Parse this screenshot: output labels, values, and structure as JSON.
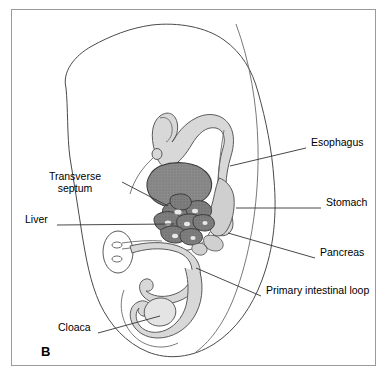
{
  "figure": {
    "panel_letter": "B",
    "caption_absent": true,
    "border_color": "#9a9a9a",
    "background_color": "#ffffff"
  },
  "palette": {
    "outline": "#4a4a4a",
    "gut_fill": "#d8d8d8",
    "gut_stroke": "#5a5a5a",
    "liver_fill": "#8a8a8a",
    "liver_stroke": "#3c3c3c",
    "septum_fill": "#8a8a8a",
    "septum_stroke": "#3c3c3c",
    "leader_line": "#333333",
    "text": "#000000"
  },
  "labels": [
    {
      "id": "esophagus",
      "text": "Esophagus",
      "x": 311,
      "y": 142,
      "align": "left",
      "leader": {
        "x1": 306,
        "y1": 148,
        "x2": 230,
        "y2": 166
      }
    },
    {
      "id": "stomach",
      "text": "Stomach",
      "x": 326,
      "y": 202,
      "align": "left",
      "leader": {
        "x1": 321,
        "y1": 208,
        "x2": 236,
        "y2": 208
      }
    },
    {
      "id": "pancreas",
      "text": "Pancreas",
      "x": 320,
      "y": 252,
      "align": "left",
      "leader": {
        "x1": 315,
        "y1": 258,
        "x2": 228,
        "y2": 233
      }
    },
    {
      "id": "primary-intestinal-loop",
      "text": "Primary intestinal loop",
      "x": 266,
      "y": 290,
      "width": 104,
      "align": "left",
      "two_line": true,
      "leader": {
        "x1": 261,
        "y1": 296,
        "x2": 196,
        "y2": 268
      }
    },
    {
      "id": "transverse-septum",
      "text": "Transverse septum",
      "x": 32,
      "y": 176,
      "width": 86,
      "align": "center",
      "two_line": true,
      "leader": {
        "x1": 122,
        "y1": 182,
        "x2": 168,
        "y2": 206
      }
    },
    {
      "id": "liver",
      "text": "Liver",
      "x": 25,
      "y": 219,
      "align": "left",
      "leader": {
        "x1": 57,
        "y1": 225,
        "x2": 174,
        "y2": 224
      }
    },
    {
      "id": "cloaca",
      "text": "Cloaca",
      "x": 58,
      "y": 327,
      "align": "left",
      "leader": {
        "x1": 98,
        "y1": 333,
        "x2": 160,
        "y2": 316
      }
    }
  ],
  "structures": [
    {
      "id": "embryo-body-outline",
      "name": "embryo body wall outline"
    },
    {
      "id": "amnion-line",
      "name": "amniotic / body wall boundary line"
    },
    {
      "id": "foregut-arch",
      "name": "foregut arch with pharynx"
    },
    {
      "id": "esophagus-tube",
      "name": "esophagus"
    },
    {
      "id": "stomach-body",
      "name": "stomach"
    },
    {
      "id": "duodenum",
      "name": "duodenum"
    },
    {
      "id": "pancreas-buds",
      "name": "dorsal and ventral pancreatic buds"
    },
    {
      "id": "transverse-septum-mass",
      "name": "transverse septum"
    },
    {
      "id": "liver-mass",
      "name": "liver cords"
    },
    {
      "id": "umbilical-ring",
      "name": "umbilical ring with vessels"
    },
    {
      "id": "vitelline-duct",
      "name": "vitelline duct"
    },
    {
      "id": "intestinal-loop",
      "name": "primary intestinal loop"
    },
    {
      "id": "hindgut",
      "name": "hindgut"
    },
    {
      "id": "cloaca-chamber",
      "name": "cloaca"
    }
  ]
}
